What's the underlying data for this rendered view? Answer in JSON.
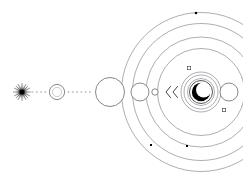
{
  "figure": {
    "background_color": "#ffffff",
    "ink_color": "#2b2b30",
    "ring_color": "#6b6b73",
    "width": 243,
    "height": 186
  },
  "chart_data": {
    "type": "scatter",
    "xlabel": "",
    "ylabel": "",
    "xlim": [
      0,
      243
    ],
    "ylim": [
      0,
      186
    ],
    "grid": false,
    "legend": false,
    "system_center": {
      "x": 201,
      "y": 92
    },
    "orbit_rings": [
      {
        "name": "orbit-1",
        "radius": 13.5
      },
      {
        "name": "orbit-2",
        "radius": 17.0
      },
      {
        "name": "orbit-3",
        "radius": 20.0
      },
      {
        "name": "orbit-4",
        "radius": 43.5
      },
      {
        "name": "orbit-5",
        "radius": 55.0
      },
      {
        "name": "orbit-6",
        "radius": 68.5
      },
      {
        "name": "orbit-7",
        "radius": 79.5
      }
    ],
    "bodies": [
      {
        "name": "starburst-source",
        "x": 22,
        "y": 92,
        "r": 7.5,
        "kind": "starburst"
      },
      {
        "name": "double-ring-body",
        "x": 57,
        "y": 92,
        "r": 7.5,
        "kind": "double-ring"
      },
      {
        "name": "large-circle-body",
        "x": 110,
        "y": 92,
        "r": 14.5,
        "kind": "circle"
      },
      {
        "name": "medium-circle-body",
        "x": 140,
        "y": 92,
        "r": 9.0,
        "kind": "circle"
      },
      {
        "name": "small-circle-body",
        "x": 155,
        "y": 92,
        "r": 3.2,
        "kind": "circle"
      },
      {
        "name": "right-circle-body",
        "x": 229,
        "y": 92,
        "r": 9.0,
        "kind": "circle"
      },
      {
        "name": "eclipse-core",
        "x": 201,
        "y": 92,
        "r": 11.5,
        "kind": "crescent"
      }
    ],
    "markers": [
      {
        "name": "marker-top-outer",
        "x": 196,
        "y": 13,
        "kind": "filled-square",
        "size": 2.2
      },
      {
        "name": "marker-lower-left",
        "x": 151,
        "y": 145,
        "kind": "filled-square",
        "size": 2.0
      },
      {
        "name": "marker-bottom",
        "x": 187,
        "y": 146,
        "kind": "filled-square",
        "size": 2.0
      },
      {
        "name": "marker-upper-right-open",
        "x": 189,
        "y": 68,
        "kind": "open-square",
        "size": 3.4
      },
      {
        "name": "marker-lower-right-open",
        "x": 224,
        "y": 110,
        "kind": "open-square",
        "size": 3.4
      }
    ],
    "chevrons": [
      {
        "name": "chevron-outer",
        "x": 167,
        "y": 92,
        "direction": "left"
      },
      {
        "name": "chevron-inner",
        "x": 174,
        "y": 92,
        "direction": "left"
      }
    ],
    "trails": [
      {
        "name": "trail-left",
        "x1": 32,
        "y1": 92,
        "x2": 48,
        "y2": 92
      },
      {
        "name": "trail-mid",
        "x1": 68,
        "y1": 92,
        "x2": 93,
        "y2": 92
      }
    ],
    "crescent": {
      "name": "eclipse-crescent",
      "outer_r": 9.2,
      "inner_r": 7.6,
      "offset_x": 2.6,
      "offset_y": -2.2,
      "opening": "upper-right"
    },
    "annotations": []
  }
}
